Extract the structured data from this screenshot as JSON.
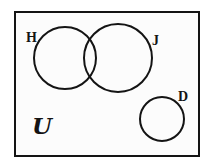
{
  "figure": {
    "kind": "venn-diagram",
    "title": "",
    "background_color": "#ffffff",
    "stroke_color": "#141414",
    "fill_color": "#fcfcfc"
  },
  "universe": {
    "name": "universal-set",
    "symbol": "U",
    "label": "U",
    "shape": "rectangle",
    "x": 14,
    "y": 11,
    "width": 186,
    "height": 146,
    "stroke_width": 2
  },
  "sets": [
    {
      "id": "H",
      "label": "H",
      "shape": "circle",
      "cx": 65,
      "cy": 58,
      "r": 31,
      "stroke_width": 2,
      "label_x": 26,
      "label_y": 31
    },
    {
      "id": "J",
      "label": "J",
      "shape": "circle",
      "cx": 118,
      "cy": 58,
      "r": 34,
      "stroke_width": 2,
      "label_x": 152,
      "label_y": 34
    },
    {
      "id": "D",
      "label": "D",
      "shape": "circle",
      "cx": 162,
      "cy": 119,
      "r": 22,
      "stroke_width": 2,
      "label_x": 178,
      "label_y": 90
    }
  ],
  "relations": {
    "overlapping_pairs": [
      [
        "H",
        "J"
      ]
    ],
    "disjoint_sets": [
      "D"
    ]
  }
}
